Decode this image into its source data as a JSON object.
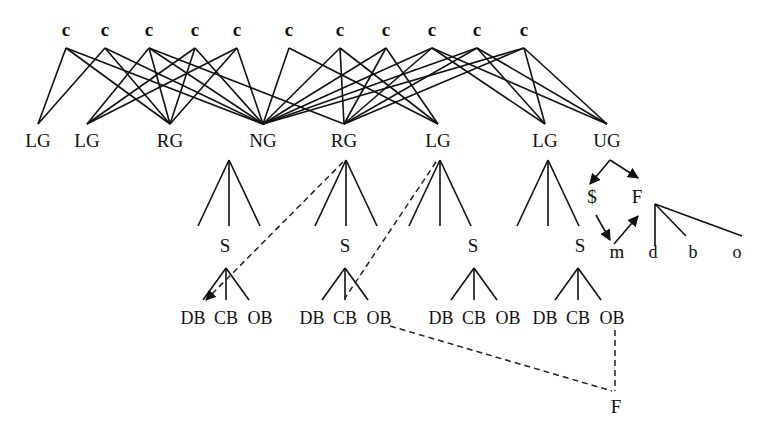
{
  "diagram": {
    "top_nodes": [
      "c",
      "c",
      "c",
      "c",
      "c",
      "c",
      "c",
      "c",
      "c",
      "c",
      "c"
    ],
    "middle_nodes": [
      "LG",
      "LG",
      "RG",
      "NG",
      "RG",
      "LG",
      "LG",
      "UG"
    ],
    "top_to_middle_edges": [
      [
        0,
        0
      ],
      [
        0,
        2
      ],
      [
        0,
        3
      ],
      [
        1,
        0
      ],
      [
        1,
        2
      ],
      [
        1,
        3
      ],
      [
        2,
        1
      ],
      [
        2,
        2
      ],
      [
        2,
        3
      ],
      [
        2,
        4
      ],
      [
        3,
        1
      ],
      [
        3,
        2
      ],
      [
        3,
        3
      ],
      [
        4,
        1
      ],
      [
        4,
        2
      ],
      [
        4,
        3
      ],
      [
        5,
        3
      ],
      [
        5,
        5
      ],
      [
        6,
        3
      ],
      [
        6,
        4
      ],
      [
        6,
        5
      ],
      [
        7,
        3
      ],
      [
        7,
        4
      ],
      [
        7,
        5
      ],
      [
        8,
        3
      ],
      [
        8,
        4
      ],
      [
        8,
        6
      ],
      [
        8,
        7
      ],
      [
        9,
        3
      ],
      [
        9,
        4
      ],
      [
        9,
        6
      ],
      [
        9,
        7
      ],
      [
        10,
        3
      ],
      [
        10,
        4
      ],
      [
        10,
        6
      ],
      [
        10,
        7
      ]
    ],
    "subtrees": [
      {
        "parent": "NG",
        "s_label": "S",
        "leaves": [
          "DB",
          "CB",
          "OB"
        ]
      },
      {
        "parent": "RG",
        "s_label": "S",
        "leaves": [
          "DB",
          "CB",
          "OB"
        ]
      },
      {
        "parent": "LG",
        "s_label": "S",
        "leaves": [
          "DB",
          "CB",
          "OB"
        ]
      },
      {
        "parent": "LG",
        "s_label": "S",
        "leaves": [
          "DB",
          "CB",
          "OB"
        ]
      }
    ],
    "ug_cycle": {
      "nodes": [
        "$",
        "F",
        "m"
      ],
      "arrows": [
        [
          "UG",
          "$"
        ],
        [
          "UG",
          "F"
        ],
        [
          "$",
          "m"
        ],
        [
          "m",
          "F"
        ]
      ]
    },
    "f_tree": {
      "leaves": [
        "d",
        "b",
        "o"
      ]
    },
    "dashed_links": [
      {
        "from": "RG",
        "to": "DB"
      },
      {
        "from": "LG",
        "to": "CB"
      },
      {
        "from": "OB",
        "to": "F"
      },
      {
        "from": "OB",
        "to": "F"
      }
    ],
    "bottom_node": "F"
  }
}
